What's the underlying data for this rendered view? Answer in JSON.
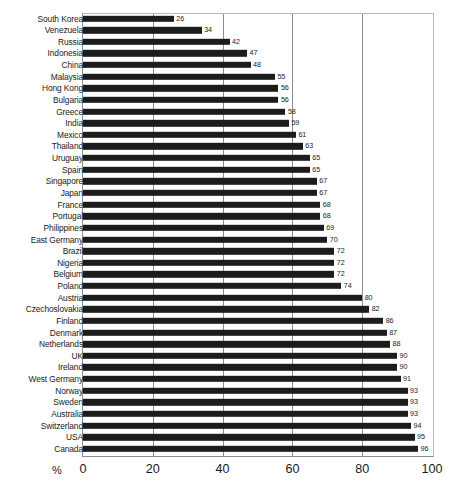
{
  "chart_data": {
    "type": "bar",
    "orientation": "horizontal",
    "title": "",
    "subtitle": "",
    "xlabel": "%",
    "ylabel": "",
    "xlim": [
      0,
      100
    ],
    "grid": true,
    "legend": null,
    "xticks": [
      0,
      20,
      40,
      60,
      80,
      100
    ],
    "xtick_labels": [
      "0",
      "20",
      "40",
      "60",
      "80",
      "100"
    ],
    "bar_color": "#1c1c1c",
    "categories": [
      "South Korea",
      "Venezuela",
      "Russia",
      "Indonesia",
      "China",
      "Malaysia",
      "Hong Kong",
      "Bulgaria",
      "Greece",
      "India",
      "Mexico",
      "Thailand",
      "Uruguay",
      "Spain",
      "Singapore",
      "Japan",
      "France",
      "Portugal",
      "Philippines",
      "East Germany",
      "Brazil",
      "Nigeria",
      "Belgium",
      "Poland",
      "Austria",
      "Czechoslovakia",
      "Finland",
      "Denmark",
      "Netherlands",
      "UK",
      "Ireland",
      "West Germany",
      "Norway",
      "Sweden",
      "Australia",
      "Switzerland",
      "USA",
      "Canada"
    ],
    "values": [
      26,
      34,
      42,
      47,
      48,
      55,
      56,
      56,
      58,
      59,
      61,
      63,
      65,
      65,
      67,
      67,
      68,
      68,
      69,
      70,
      72,
      72,
      72,
      74,
      80,
      82,
      86,
      87,
      88,
      90,
      90,
      91,
      93,
      93,
      93,
      94,
      95,
      96
    ],
    "rows": [
      {
        "label": "South Korea",
        "value": 26
      },
      {
        "label": "Venezuela",
        "value": 34
      },
      {
        "label": "Russia",
        "value": 42
      },
      {
        "label": "Indonesia",
        "value": 47
      },
      {
        "label": "China",
        "value": 48
      },
      {
        "label": "Malaysia",
        "value": 55
      },
      {
        "label": "Hong Kong",
        "value": 56
      },
      {
        "label": "Bulgaria",
        "value": 56
      },
      {
        "label": "Greece",
        "value": 58
      },
      {
        "label": "India",
        "value": 59
      },
      {
        "label": "Mexico",
        "value": 61
      },
      {
        "label": "Thailand",
        "value": 63
      },
      {
        "label": "Uruguay",
        "value": 65
      },
      {
        "label": "Spain",
        "value": 65
      },
      {
        "label": "Singapore",
        "value": 67
      },
      {
        "label": "Japan",
        "value": 67
      },
      {
        "label": "France",
        "value": 68
      },
      {
        "label": "Portugal",
        "value": 68
      },
      {
        "label": "Philippines",
        "value": 69
      },
      {
        "label": "East Germany",
        "value": 70
      },
      {
        "label": "Brazil",
        "value": 72
      },
      {
        "label": "Nigeria",
        "value": 72
      },
      {
        "label": "Belgium",
        "value": 72
      },
      {
        "label": "Poland",
        "value": 74
      },
      {
        "label": "Austria",
        "value": 80
      },
      {
        "label": "Czechoslovakia",
        "value": 82
      },
      {
        "label": "Finland",
        "value": 86
      },
      {
        "label": "Denmark",
        "value": 87
      },
      {
        "label": "Netherlands",
        "value": 88
      },
      {
        "label": "UK",
        "value": 90
      },
      {
        "label": "Ireland",
        "value": 90
      },
      {
        "label": "West Germany",
        "value": 91
      },
      {
        "label": "Norway",
        "value": 93
      },
      {
        "label": "Sweden",
        "value": 93
      },
      {
        "label": "Australia",
        "value": 93
      },
      {
        "label": "Switzerland",
        "value": 94
      },
      {
        "label": "USA",
        "value": 95
      },
      {
        "label": "Canada",
        "value": 96
      }
    ]
  }
}
